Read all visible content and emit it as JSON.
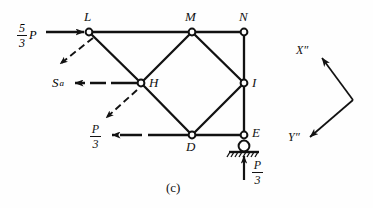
{
  "figure": {
    "caption": "(c)",
    "nodes": [
      {
        "id": "L",
        "label": "L",
        "x": 89,
        "y": 32,
        "label_x": 84,
        "label_y": 12
      },
      {
        "id": "M",
        "label": "M",
        "x": 192,
        "y": 32,
        "label_x": 186,
        "label_y": 12
      },
      {
        "id": "N",
        "label": "N",
        "x": 244,
        "y": 32,
        "label_x": 238,
        "label_y": 12
      },
      {
        "id": "H",
        "label": "H",
        "x": 141,
        "y": 83,
        "label_x": 148,
        "label_y": 78
      },
      {
        "id": "I",
        "label": "I",
        "x": 244,
        "y": 83,
        "label_x": 252,
        "label_y": 78
      },
      {
        "id": "D",
        "label": "D",
        "x": 192,
        "y": 135,
        "label_x": 186,
        "label_y": 141
      },
      {
        "id": "E",
        "label": "E",
        "x": 244,
        "y": 135,
        "label_x": 252,
        "label_y": 128
      }
    ],
    "members": [
      [
        "L",
        "M"
      ],
      [
        "M",
        "N"
      ],
      [
        "L",
        "H"
      ],
      [
        "H",
        "M"
      ],
      [
        "H",
        "D"
      ],
      [
        "D",
        "M"
      ],
      [
        "D",
        "I"
      ],
      [
        "M",
        "I"
      ],
      [
        "N",
        "I"
      ],
      [
        "I",
        "E"
      ],
      [
        "D",
        "E"
      ]
    ],
    "support": {
      "type": "roller-support",
      "node": "E",
      "x": 244,
      "y": 145
    },
    "forces": [
      {
        "name": "applied-load-L",
        "numerator": "5",
        "denominator": "3",
        "symbol": "P",
        "label_x": 17,
        "label_y": 22,
        "arrow": {
          "x1": 46,
          "y1": 32,
          "x2": 85,
          "y2": 32
        },
        "style": "solid"
      },
      {
        "name": "reaction-Sa-H",
        "text": "S",
        "subscript": "a",
        "label_x": 54,
        "label_y": 76,
        "arrow": {
          "x1": 137,
          "y1": 83,
          "x2": 73,
          "y2": 83
        },
        "style": "dashed-solid"
      },
      {
        "name": "applied-load-D",
        "numerator": "P",
        "denominator": "3",
        "symbol": "",
        "label_x": 90,
        "label_y": 125,
        "arrow": {
          "x1": 188,
          "y1": 135,
          "x2": 110,
          "y2": 135
        },
        "style": "dashed-solid"
      },
      {
        "name": "reaction-E",
        "numerator": "P",
        "denominator": "3",
        "symbol": "",
        "label_x": 252,
        "label_y": 160,
        "arrow": {
          "x1": 244,
          "y1": 180,
          "x2": 244,
          "y2": 154
        },
        "style": "solid"
      }
    ],
    "displacement_arrows": [
      {
        "name": "displacement-arrow-L",
        "x1": 92,
        "y1": 37,
        "x2": 58,
        "y2": 65
      },
      {
        "name": "displacement-arrow-H",
        "x1": 136,
        "y1": 90,
        "x2": 104,
        "y2": 120
      }
    ],
    "axes": {
      "vertex": {
        "x": 353,
        "y": 100
      },
      "x_axis": {
        "label": "X″",
        "tip_x": 320,
        "tip_y": 57,
        "label_x": 297,
        "label_y": 45
      },
      "y_axis": {
        "label": "Y″",
        "tip_x": 307,
        "tip_y": 139,
        "label_x": 290,
        "label_y": 133
      }
    },
    "colors": {
      "ink": "#121212",
      "background": "#fefefe"
    }
  }
}
